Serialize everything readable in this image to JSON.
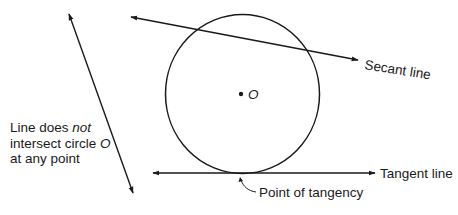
{
  "diagram": {
    "circle": {
      "label": "O",
      "center": [
        242,
        94
      ],
      "radius": 79
    },
    "lines": {
      "secant": {
        "label": "Secant line",
        "from": [
          131,
          17
        ],
        "to": [
          358,
          60
        ]
      },
      "tangent": {
        "label": "Tangent line",
        "from": [
          153,
          173
        ],
        "to": [
          375,
          173
        ]
      },
      "non_intersecting": {
        "from": [
          69,
          14
        ],
        "to": [
          133,
          193
        ]
      }
    },
    "annotations": {
      "non_intersecting_line_1": "Line does ",
      "non_intersecting_line_1_italic": "not",
      "non_intersecting_line_2": "intersect circle ",
      "non_intersecting_line_2_italic": "O",
      "non_intersecting_line_3": "at any point",
      "point_of_tangency": "Point of tangency"
    },
    "colors": {
      "stroke": "#1a1a1a",
      "background": "#ffffff"
    }
  }
}
